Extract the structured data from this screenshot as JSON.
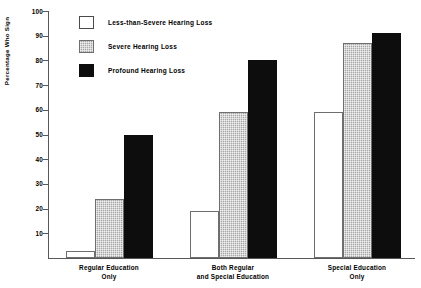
{
  "chart_data": {
    "type": "bar",
    "title": "",
    "xlabel": "",
    "ylabel": "Percentage Who Sign",
    "ylim": [
      0,
      100
    ],
    "yticks": [
      10,
      20,
      30,
      40,
      50,
      60,
      70,
      80,
      90,
      100
    ],
    "grid": false,
    "legend_position": "upper-left-inside",
    "categories": [
      "Regular Education\nOnly",
      "Both Regular\nand Special Education",
      "Special Education\nOnly"
    ],
    "category_lines": [
      [
        "Regular Education",
        "Only"
      ],
      [
        "Both Regular",
        "and Special Education"
      ],
      [
        "Special Education",
        "Only"
      ]
    ],
    "series": [
      {
        "name": "Less-than-Severe Hearing Loss",
        "fill": "white",
        "color": "#ffffff",
        "values": [
          3,
          19,
          59
        ]
      },
      {
        "name": "Severe Hearing Loss",
        "fill": "gray-hatch",
        "color": "#a7a7a7",
        "values": [
          24,
          59,
          87
        ]
      },
      {
        "name": "Profound Hearing Loss",
        "fill": "solid-black",
        "color": "#0d0d0d",
        "values": [
          50,
          80,
          91
        ]
      }
    ]
  },
  "axis": {
    "y_title": "Percentage Who Sign",
    "tick_labels": [
      "100",
      "90",
      "80",
      "70",
      "60",
      "50",
      "40",
      "30",
      "20",
      "10"
    ]
  },
  "legend": {
    "items": [
      {
        "label": "Less-than-Severe Hearing Loss",
        "swatch": "white"
      },
      {
        "label": "Severe Hearing Loss",
        "swatch": "gray"
      },
      {
        "label": "Profound Hearing Loss",
        "swatch": "black"
      }
    ]
  },
  "colors": {
    "axis": "#58585a",
    "bar_outline": "#6e6e70",
    "black_fill": "#0d0d0d",
    "gray_fill": "#a7a7a7",
    "white_fill": "#ffffff",
    "background": "#ffffff"
  }
}
